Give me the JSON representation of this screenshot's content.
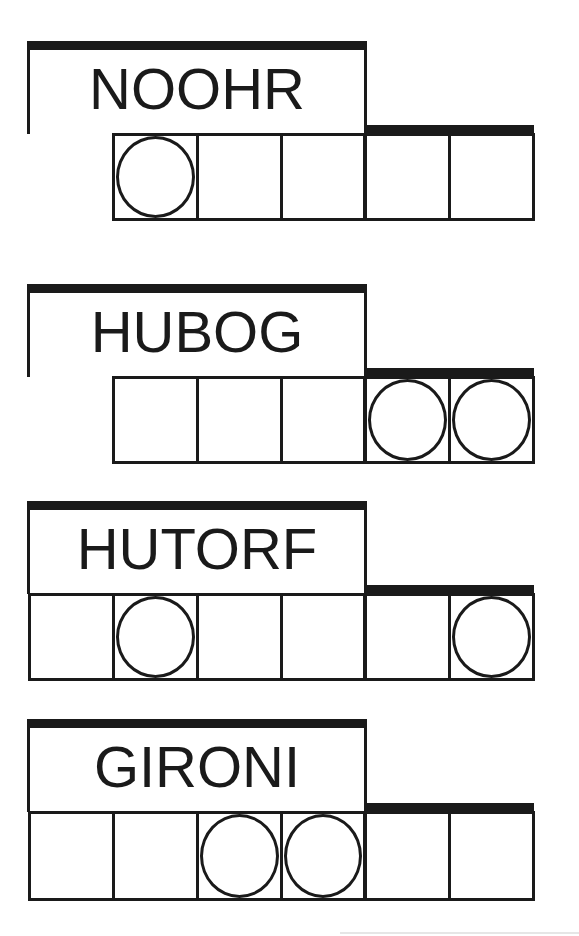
{
  "puzzles": [
    {
      "clue": "NOOHR",
      "cell_count": 5,
      "circled_cells": [
        1
      ],
      "cells_offset": "indented"
    },
    {
      "clue": "HUBOG",
      "cell_count": 5,
      "circled_cells": [
        4,
        5
      ],
      "cells_offset": "indented"
    },
    {
      "clue": "HUTORF",
      "cell_count": 6,
      "circled_cells": [
        2,
        6
      ],
      "cells_offset": "flush"
    },
    {
      "clue": "GIRONI",
      "cell_count": 6,
      "circled_cells": [
        3,
        4
      ],
      "cells_offset": "flush"
    }
  ],
  "colors": {
    "ink": "#1a1a1a",
    "background": "#ffffff"
  }
}
